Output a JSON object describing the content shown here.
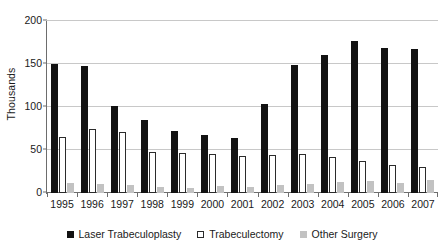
{
  "chart_data": {
    "type": "bar",
    "title": "",
    "subtitle": "",
    "xlabel": "",
    "ylabel": "Thousands",
    "ylim": [
      0,
      200
    ],
    "yticks": [
      0,
      50,
      100,
      150,
      200
    ],
    "ytick_labels": [
      "0",
      "50",
      "100",
      "150",
      "200"
    ],
    "grid": true,
    "legend_position": "bottom",
    "categories": [
      "1995",
      "1996",
      "1997",
      "1998",
      "1999",
      "2000",
      "2001",
      "2002",
      "2003",
      "2004",
      "2005",
      "2006",
      "2007"
    ],
    "series": [
      {
        "name": "Laser Trabeculoplasty",
        "color": "#121212",
        "values": [
          150,
          148,
          101,
          85,
          72,
          67,
          64,
          103,
          149,
          160,
          177,
          169,
          167
        ]
      },
      {
        "name": "Trabeculectomy",
        "color": "#ffffff",
        "values": [
          65,
          75,
          71,
          48,
          46,
          45,
          43,
          44,
          45,
          42,
          37,
          33,
          30
        ]
      },
      {
        "name": "Other Surgery",
        "color": "#c2c2c2",
        "values": [
          12,
          10,
          9,
          7,
          6,
          8,
          7,
          9,
          10,
          13,
          14,
          12,
          15
        ]
      }
    ]
  }
}
